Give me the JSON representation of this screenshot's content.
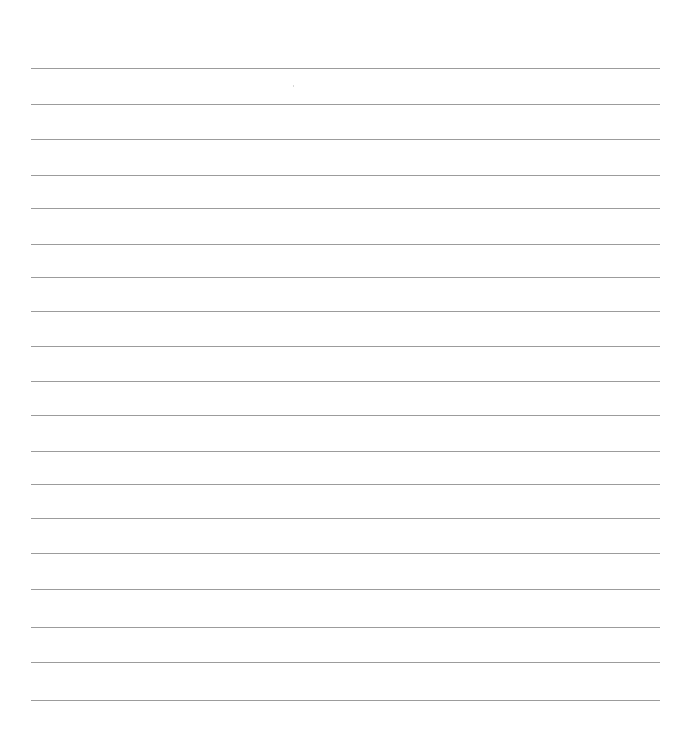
{
  "document": {
    "type": "lined-paper",
    "background_color": "#ffffff",
    "line_color": "#9c9c9c",
    "line_count": 19,
    "line_left": 31,
    "line_right": 660,
    "line_positions": [
      68,
      104,
      139,
      175,
      208,
      244,
      277,
      311,
      346,
      381,
      415,
      451,
      484,
      518,
      553,
      589,
      627,
      662,
      700
    ]
  }
}
